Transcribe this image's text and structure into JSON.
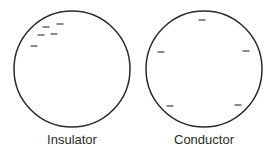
{
  "diagram": {
    "colors": {
      "stroke": "#2a2a2a",
      "background": "#ffffff"
    },
    "objects": [
      {
        "id": "insulator",
        "label": "Insulator",
        "circle": {
          "cx": 72,
          "cy": 69,
          "r": 58
        },
        "charge_symbol": "−",
        "charges": [
          {
            "x": 46,
            "y": 27
          },
          {
            "x": 60,
            "y": 24
          },
          {
            "x": 41,
            "y": 35
          },
          {
            "x": 54,
            "y": 34
          },
          {
            "x": 34,
            "y": 46
          }
        ],
        "description": "Charges clustered in one region"
      },
      {
        "id": "conductor",
        "label": "Conductor",
        "circle": {
          "cx": 204,
          "cy": 69,
          "r": 58
        },
        "charge_symbol": "−",
        "charges": [
          {
            "x": 202,
            "y": 20
          },
          {
            "x": 161,
            "y": 52
          },
          {
            "x": 246,
            "y": 51
          },
          {
            "x": 170,
            "y": 106
          },
          {
            "x": 238,
            "y": 105
          }
        ],
        "description": "Charges spread evenly over surface"
      }
    ]
  }
}
